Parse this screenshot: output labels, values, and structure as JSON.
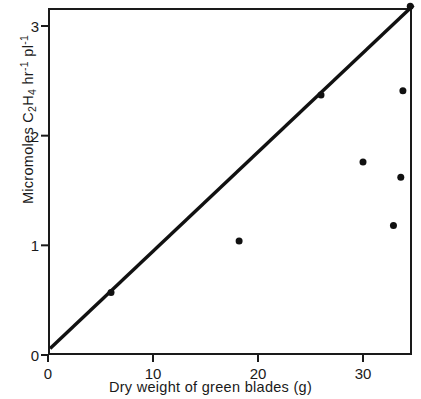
{
  "chart_data": {
    "type": "scatter",
    "title": "",
    "xlabel": "Dry weight of green blades (g)",
    "ylabel": "Micromoles C2H4 hr-1 pl-1",
    "ylabel_parts": {
      "prefix": "Micromoles C",
      "sub1": "2",
      "mid1": "H",
      "sub2": "4",
      "mid2": " hr",
      "sup1": "-1",
      "mid3": " pl",
      "sup2": "-1"
    },
    "xlim": [
      0,
      34.7
    ],
    "ylim": [
      0,
      3.16
    ],
    "xticks": [
      0,
      10,
      20,
      30
    ],
    "xtick_labels": [
      "0",
      "10",
      "20",
      "30"
    ],
    "yticks": [
      0,
      1,
      2,
      3
    ],
    "ytick_labels": [
      "0",
      "1",
      "2",
      "3"
    ],
    "grid": false,
    "legend": null,
    "points": [
      {
        "x": 6.0,
        "y": 0.57
      },
      {
        "x": 18.2,
        "y": 1.04
      },
      {
        "x": 26.0,
        "y": 2.37
      },
      {
        "x": 30.0,
        "y": 1.76
      },
      {
        "x": 32.9,
        "y": 1.18
      },
      {
        "x": 33.6,
        "y": 1.62
      },
      {
        "x": 33.8,
        "y": 2.41
      },
      {
        "x": 34.5,
        "y": 3.18
      }
    ],
    "fit_line": {
      "x1": 0.2,
      "y1": 0.06,
      "x2": 34.8,
      "y2": 3.19
    },
    "marker": {
      "shape": "circle",
      "size_px": 7,
      "color": "#111111"
    },
    "line_color": "#111111",
    "axis_color": "#1a1a1a",
    "background": "#ffffff"
  }
}
